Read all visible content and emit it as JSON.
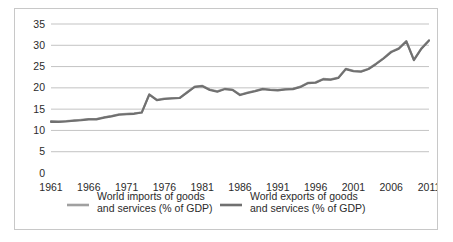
{
  "chart_data": {
    "type": "line",
    "title": "",
    "xlabel": "",
    "ylabel": "",
    "ylim": [
      0,
      35
    ],
    "ytick_step": 5,
    "xlim": [
      1961,
      2011
    ],
    "xtick_step": 5,
    "grid": "horizontal",
    "legend_position": "bottom",
    "ytick_labels": [
      "0",
      "5",
      "10",
      "15",
      "20",
      "25",
      "30",
      "35"
    ],
    "ytick_values": [
      0,
      5,
      10,
      15,
      20,
      25,
      30,
      35
    ],
    "xtick_labels": [
      "1961",
      "1966",
      "1971",
      "1976",
      "1981",
      "1986",
      "1991",
      "1996",
      "2001",
      "2006",
      "2011"
    ],
    "xtick_values": [
      1961,
      1966,
      1971,
      1976,
      1981,
      1986,
      1991,
      1996,
      2001,
      2006,
      2011
    ],
    "x": [
      1961,
      1962,
      1963,
      1964,
      1965,
      1966,
      1967,
      1968,
      1969,
      1970,
      1971,
      1972,
      1973,
      1974,
      1975,
      1976,
      1977,
      1978,
      1979,
      1980,
      1981,
      1982,
      1983,
      1984,
      1985,
      1986,
      1987,
      1988,
      1989,
      1990,
      1991,
      1992,
      1993,
      1994,
      1995,
      1996,
      1997,
      1998,
      1999,
      2000,
      2001,
      2002,
      2003,
      2004,
      2005,
      2006,
      2007,
      2008,
      2009,
      2010,
      2011
    ],
    "series": [
      {
        "name": "World imports of goods and services (% of GDP)",
        "color": "#a0a0a0",
        "values": [
          12.2,
          12.1,
          12.2,
          12.3,
          12.5,
          12.7,
          12.7,
          13.1,
          13.4,
          13.8,
          13.9,
          14.0,
          14.2,
          18.5,
          17.2,
          17.5,
          17.6,
          17.6,
          19.0,
          20.3,
          20.5,
          19.6,
          19.2,
          19.8,
          19.6,
          18.4,
          18.9,
          19.3,
          19.8,
          19.6,
          19.5,
          19.7,
          19.8,
          20.3,
          21.2,
          21.3,
          22.1,
          22.0,
          22.4,
          24.5,
          24.0,
          23.9,
          24.5,
          25.7,
          27.0,
          28.5,
          29.3,
          31.0,
          26.6,
          29.3,
          31.2
        ]
      },
      {
        "name": "World exports of goods and services (% of GDP)",
        "color": "#707070",
        "values": [
          12.0,
          12.0,
          12.1,
          12.3,
          12.4,
          12.6,
          12.6,
          13.0,
          13.3,
          13.7,
          13.8,
          13.9,
          14.2,
          18.4,
          17.1,
          17.4,
          17.5,
          17.6,
          18.9,
          20.2,
          20.4,
          19.5,
          19.1,
          19.7,
          19.5,
          18.3,
          18.8,
          19.2,
          19.7,
          19.5,
          19.4,
          19.6,
          19.7,
          20.2,
          21.1,
          21.2,
          22.0,
          21.9,
          22.3,
          24.4,
          23.9,
          23.8,
          24.4,
          25.6,
          26.9,
          28.4,
          29.2,
          30.9,
          26.5,
          29.2,
          31.1
        ]
      }
    ]
  },
  "legend": {
    "entries": [
      {
        "label_line1": "World imports of goods",
        "label_line2": "and services (% of GDP)",
        "color": "#a0a0a0"
      },
      {
        "label_line1": "World exports of goods",
        "label_line2": "and services (% of GDP)",
        "color": "#707070"
      }
    ]
  },
  "colors": {
    "imports": "#a0a0a0",
    "exports": "#707070",
    "gridline": "#b4b4b4",
    "border": "#c8c8c8",
    "text": "#2b2b2b",
    "background": "#ffffff"
  }
}
